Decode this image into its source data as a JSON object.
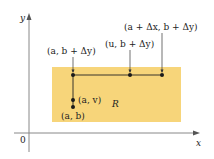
{
  "diagram": {
    "axes": {
      "x_label": "x",
      "y_label": "y",
      "origin_label": "0",
      "axis_color": "#777777"
    },
    "region": {
      "label": "R",
      "fill_color": "#f7d57a"
    },
    "points": [
      {
        "id": "a_b_dy",
        "label": "(a, b + Δy)"
      },
      {
        "id": "u_b_dy",
        "label": "(u, b + Δy)"
      },
      {
        "id": "a_dx_b_dy",
        "label": "(a + Δx, b + Δy)"
      },
      {
        "id": "a_v",
        "label": "(a, v)"
      },
      {
        "id": "a_b",
        "label": "(a, b)"
      }
    ],
    "colors": {
      "point": "#1a1a1a",
      "path_line": "#222222"
    }
  }
}
